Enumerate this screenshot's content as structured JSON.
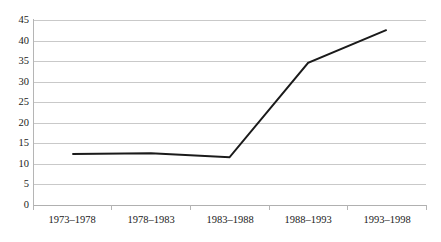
{
  "chart_data": {
    "type": "line",
    "title": "",
    "subtitle": "",
    "xlabel": "",
    "ylabel": "",
    "categories": [
      "1973–1978",
      "1978–1983",
      "1983–1988",
      "1988–1993",
      "1993–1998"
    ],
    "series": [
      {
        "name": "",
        "values": [
          12.4,
          12.6,
          11.6,
          34.6,
          42.6
        ],
        "color": "#1a1a1a",
        "line_width": 2
      }
    ],
    "ylim": [
      0,
      45
    ],
    "yticks": [
      0,
      5,
      10,
      15,
      20,
      25,
      30,
      35,
      40,
      45
    ],
    "ytick_labels": [
      "0",
      "5",
      "10",
      "15",
      "20",
      "25",
      "30",
      "35",
      "40",
      "45"
    ],
    "grid": {
      "horizontal": true,
      "vertical": false,
      "color": "#c9c9c9"
    },
    "legend": {
      "visible": false,
      "position": "none",
      "entries": []
    },
    "markers": false,
    "annotations": []
  }
}
